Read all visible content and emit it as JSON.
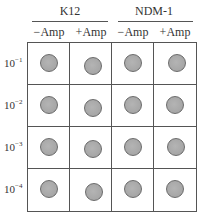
{
  "groups": [
    {
      "label": "K12",
      "columns": [
        "−Amp",
        "+Amp"
      ]
    },
    {
      "label": "NDM-1",
      "columns": [
        "−Amp",
        "+Amp"
      ]
    }
  ],
  "rows": [
    {
      "base": "10",
      "exp": "−1"
    },
    {
      "base": "10",
      "exp": "−2"
    },
    {
      "base": "10",
      "exp": "−3"
    },
    {
      "base": "10",
      "exp": "−4"
    }
  ],
  "dot_color": "#a8a8a8",
  "dot_offsets": [
    [
      [
        0,
        0
      ],
      [
        2,
        3
      ],
      [
        0,
        0
      ],
      [
        2,
        0
      ]
    ],
    [
      [
        0,
        0
      ],
      [
        2,
        3
      ],
      [
        0,
        0
      ],
      [
        0,
        0
      ]
    ],
    [
      [
        0,
        0
      ],
      [
        2,
        2
      ],
      [
        0,
        0
      ],
      [
        1,
        0
      ]
    ],
    [
      [
        0,
        0
      ],
      [
        3,
        3
      ],
      [
        0,
        0
      ],
      [
        0,
        0
      ]
    ]
  ]
}
